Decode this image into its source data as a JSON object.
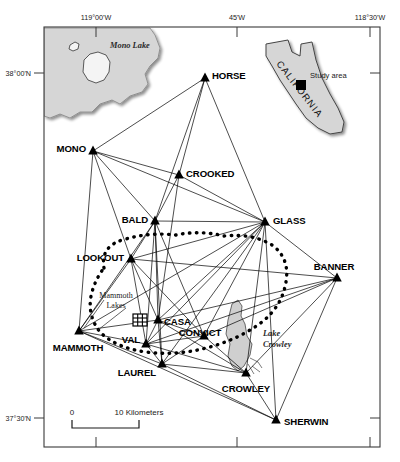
{
  "figure": {
    "type": "map"
  },
  "graticule": {
    "top_labels": [
      {
        "text": "119°00'W",
        "x": 96
      },
      {
        "text": "45'W",
        "x": 237
      },
      {
        "text": "118°30'W",
        "x": 370
      }
    ],
    "left_labels": [
      {
        "text": "38°00'N",
        "y": 73
      },
      {
        "text": "37°30'N",
        "y": 418
      }
    ]
  },
  "hydrography": [
    {
      "name": "Mono Lake",
      "label": "Mono Lake",
      "x": 110,
      "y": 48
    },
    {
      "name": "Lake Crowley",
      "label": "Lake\nCrowley",
      "x": 268,
      "y": 338
    }
  ],
  "towns": [
    {
      "name": "Mammoth Lakes",
      "label_line1": "Mammoth",
      "label_line2": "Lakes",
      "x": 116,
      "y": 300,
      "symbol_x": 139,
      "symbol_y": 320
    }
  ],
  "stations": [
    {
      "id": "HORSE",
      "label": "HORSE",
      "x": 205,
      "y": 78,
      "lx": 212,
      "ly": 76,
      "anchor": "start"
    },
    {
      "id": "MONO",
      "label": "MONO",
      "x": 93,
      "y": 151,
      "lx": 86,
      "ly": 149,
      "anchor": "end"
    },
    {
      "id": "CROOKED",
      "label": "CROOKED",
      "x": 179,
      "y": 175,
      "lx": 186,
      "ly": 174,
      "anchor": "start"
    },
    {
      "id": "BALD",
      "label": "BALD",
      "x": 155,
      "y": 221,
      "lx": 148,
      "ly": 220,
      "anchor": "end"
    },
    {
      "id": "GLASS",
      "label": "GLASS",
      "x": 265,
      "y": 222,
      "lx": 273,
      "ly": 221,
      "anchor": "start"
    },
    {
      "id": "LOOKOUT",
      "label": "LOOKOUT",
      "x": 131,
      "y": 259,
      "lx": 124,
      "ly": 258,
      "anchor": "end"
    },
    {
      "id": "BANNER",
      "label": "BANNER",
      "x": 337,
      "y": 278,
      "lx": 334,
      "ly": 267,
      "anchor": "middle"
    },
    {
      "id": "CASA",
      "label": "CASA",
      "x": 158,
      "y": 320,
      "lx": 164,
      "ly": 322,
      "anchor": "start"
    },
    {
      "id": "MAMMOTH",
      "label": "MAMMOTH",
      "x": 79,
      "y": 331,
      "lx": 78,
      "ly": 348,
      "anchor": "middle"
    },
    {
      "id": "CONVICT",
      "label": "CONVICT",
      "x": 204,
      "y": 336,
      "lx": 200,
      "ly": 333,
      "anchor": "middle"
    },
    {
      "id": "VAL",
      "label": "VAL",
      "x": 146,
      "y": 344,
      "lx": 140,
      "ly": 340,
      "anchor": "end"
    },
    {
      "id": "LAUREL",
      "label": "LAUREL",
      "x": 162,
      "y": 364,
      "lx": 156,
      "ly": 373,
      "anchor": "end"
    },
    {
      "id": "CROWLEY",
      "label": "CROWLEY",
      "x": 246,
      "y": 373,
      "lx": 246,
      "ly": 389,
      "anchor": "middle"
    },
    {
      "id": "SHERWIN",
      "label": "SHERWIN",
      "x": 276,
      "y": 420,
      "lx": 284,
      "ly": 422,
      "anchor": "start"
    }
  ],
  "baselines": [
    [
      "HORSE",
      "MONO"
    ],
    [
      "HORSE",
      "CROOKED"
    ],
    [
      "HORSE",
      "BALD"
    ],
    [
      "HORSE",
      "GLASS"
    ],
    [
      "MONO",
      "CROOKED"
    ],
    [
      "MONO",
      "BALD"
    ],
    [
      "MONO",
      "GLASS"
    ],
    [
      "MONO",
      "LOOKOUT"
    ],
    [
      "MONO",
      "MAMMOTH"
    ],
    [
      "CROOKED",
      "BALD"
    ],
    [
      "CROOKED",
      "GLASS"
    ],
    [
      "CROOKED",
      "CASA"
    ],
    [
      "BALD",
      "GLASS"
    ],
    [
      "BALD",
      "LOOKOUT"
    ],
    [
      "BALD",
      "CASA"
    ],
    [
      "BALD",
      "VAL"
    ],
    [
      "BALD",
      "LAUREL"
    ],
    [
      "BALD",
      "CONVICT"
    ],
    [
      "BALD",
      "MAMMOTH"
    ],
    [
      "GLASS",
      "LOOKOUT"
    ],
    [
      "GLASS",
      "BANNER"
    ],
    [
      "GLASS",
      "CASA"
    ],
    [
      "GLASS",
      "VAL"
    ],
    [
      "GLASS",
      "CONVICT"
    ],
    [
      "GLASS",
      "LAUREL"
    ],
    [
      "GLASS",
      "CROWLEY"
    ],
    [
      "GLASS",
      "SHERWIN"
    ],
    [
      "GLASS",
      "MAMMOTH"
    ],
    [
      "LOOKOUT",
      "CASA"
    ],
    [
      "LOOKOUT",
      "VAL"
    ],
    [
      "LOOKOUT",
      "MAMMOTH"
    ],
    [
      "LOOKOUT",
      "CONVICT"
    ],
    [
      "LOOKOUT",
      "BANNER"
    ],
    [
      "BANNER",
      "CASA"
    ],
    [
      "BANNER",
      "CONVICT"
    ],
    [
      "BANNER",
      "CROWLEY"
    ],
    [
      "BANNER",
      "SHERWIN"
    ],
    [
      "BANNER",
      "VAL"
    ],
    [
      "MAMMOTH",
      "CASA"
    ],
    [
      "MAMMOTH",
      "VAL"
    ],
    [
      "MAMMOTH",
      "LAUREL"
    ],
    [
      "MAMMOTH",
      "SHERWIN"
    ],
    [
      "CASA",
      "VAL"
    ],
    [
      "CASA",
      "LAUREL"
    ],
    [
      "CASA",
      "CONVICT"
    ],
    [
      "CASA",
      "CROWLEY"
    ],
    [
      "VAL",
      "LAUREL"
    ],
    [
      "VAL",
      "CONVICT"
    ],
    [
      "VAL",
      "CROWLEY"
    ],
    [
      "CONVICT",
      "LAUREL"
    ],
    [
      "CONVICT",
      "CROWLEY"
    ],
    [
      "LAUREL",
      "CROWLEY"
    ],
    [
      "LAUREL",
      "SHERWIN"
    ],
    [
      "CROWLEY",
      "SHERWIN"
    ]
  ],
  "inset": {
    "state_name": "CALIFORNIA",
    "study_area_label": "Study area",
    "marker_x": 300,
    "marker_y": 85
  },
  "scale_bar": {
    "zero_label": "0",
    "max_label": "10 Kilometers",
    "x_start": 72,
    "x_end": 139
  },
  "colors": {
    "land_fill": "#d6d6d6",
    "lake_fill": "#c9c9c9",
    "line": "#000000",
    "frame": "#3a3a3a",
    "background": "#ffffff"
  }
}
